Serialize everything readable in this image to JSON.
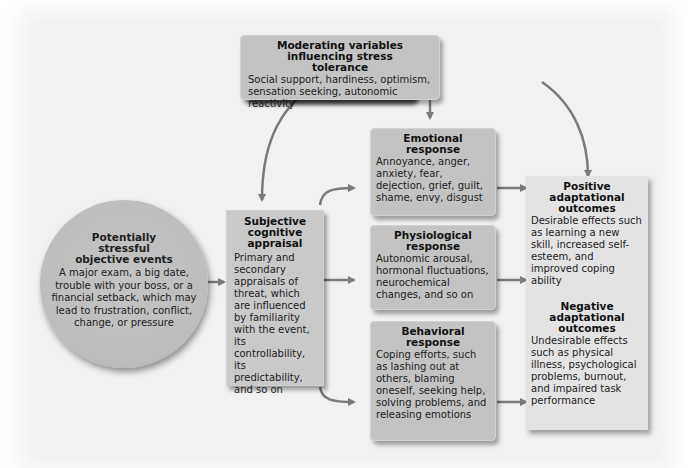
{
  "diagram": {
    "type": "flowchart",
    "colors": {
      "box_fill": "#c3c3c3",
      "outcome_fill": "#e3e3e3",
      "background": "#f1f1f1",
      "arrow": "#7a7a7a"
    }
  },
  "nodes": {
    "moderating": {
      "title": "Moderating variables influencing stress tolerance",
      "body": "Social support, hardiness, optimism, sensation seeking, autonomic reactivity"
    },
    "events": {
      "title": "Potentially stressful objective events",
      "body": "A major exam, a big date, trouble with your boss, or a financial setback, which may lead to frustration, conflict, change, or pressure"
    },
    "appraisal": {
      "title": "Subjective cognitive appraisal",
      "body": "Primary and secondary appraisals of threat, which are influenced by familiarity with the event, its controllability, its predictability, and so on"
    },
    "emotional": {
      "title": "Emotional response",
      "body": "Annoyance, anger, anxiety, fear, dejection, grief, guilt, shame, envy, disgust"
    },
    "physiological": {
      "title": "Physiological response",
      "body": "Autonomic arousal, hormonal fluctuations, neurochemical changes, and so on"
    },
    "behavioral": {
      "title": "Behavioral response",
      "body": "Coping efforts, such as lashing out at others, blaming oneself, seeking help, solving problems, and releasing emotions"
    },
    "positive": {
      "title": "Positive adaptational outcomes",
      "body": "Desirable effects such as learning a new skill, increased self-esteem, and improved coping ability"
    },
    "negative": {
      "title": "Negative adaptational outcomes",
      "body": "Undesirable effects such as physical illness, psychological problems, burnout, and impaired task performance"
    }
  },
  "edges": [
    {
      "from": "events",
      "to": "appraisal"
    },
    {
      "from": "appraisal",
      "to": "emotional"
    },
    {
      "from": "appraisal",
      "to": "physiological"
    },
    {
      "from": "appraisal",
      "to": "behavioral"
    },
    {
      "from": "emotional",
      "to": "outcomes"
    },
    {
      "from": "physiological",
      "to": "outcomes"
    },
    {
      "from": "behavioral",
      "to": "outcomes"
    },
    {
      "from": "moderating",
      "to": "appraisal"
    },
    {
      "from": "moderating",
      "to": "emotional"
    },
    {
      "from": "moderating",
      "to": "positive"
    }
  ]
}
